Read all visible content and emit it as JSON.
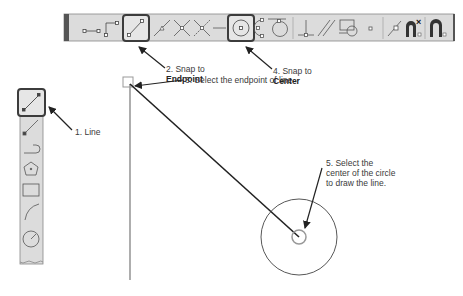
{
  "toolbar_top": {
    "name": "Object Snap toolbar",
    "buttons": [
      {
        "icon": "temporary-tracking-point-icon"
      },
      {
        "icon": "snap-from-icon"
      },
      {
        "icon": "snap-to-endpoint-icon",
        "highlighted": true
      },
      {
        "icon": "snap-to-midpoint-icon"
      },
      {
        "icon": "snap-to-intersection-icon"
      },
      {
        "icon": "snap-to-apparent-intersection-icon"
      },
      {
        "icon": "snap-to-extension-icon"
      },
      {
        "icon": "snap-to-center-icon",
        "highlighted": true
      },
      {
        "icon": "snap-to-quadrant-icon"
      },
      {
        "icon": "snap-to-tangent-icon"
      },
      {
        "icon": "snap-to-perpendicular-icon"
      },
      {
        "icon": "snap-to-parallel-icon"
      },
      {
        "icon": "snap-to-insert-icon"
      },
      {
        "icon": "snap-to-node-icon"
      },
      {
        "icon": "snap-to-nearest-icon"
      },
      {
        "icon": "snap-to-none-icon"
      },
      {
        "icon": "osnap-settings-icon"
      }
    ]
  },
  "toolbar_left": {
    "name": "Draw toolbar",
    "buttons": [
      {
        "icon": "line-icon",
        "highlighted": true
      },
      {
        "icon": "construction-line-icon"
      },
      {
        "icon": "polyline-icon"
      },
      {
        "icon": "polygon-icon"
      },
      {
        "icon": "rectangle-icon"
      },
      {
        "icon": "arc-icon"
      },
      {
        "icon": "circle-icon"
      }
    ]
  },
  "callouts": {
    "step1": "1. Line",
    "step2_line1": "2. Snap to",
    "step2_line2": "Endpoint",
    "step3": "3. Select the endpoint of line",
    "step4_line1": "4. Snap to",
    "step4_line2": "Center",
    "step5_line1": "5. Select the",
    "step5_line2": "center of the circle",
    "step5_line3": "to draw the line."
  },
  "colors": {
    "toolbar_bg": "#d9d9d9",
    "toolbar_edge": "#555555",
    "highlight_border": "#444444",
    "line": "#222222",
    "existing_line": "#777777",
    "snap_marker": "#999999"
  }
}
